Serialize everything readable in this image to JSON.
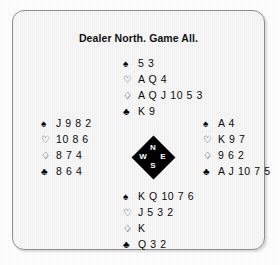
{
  "figure": {
    "title": "Dealer North. Game All.",
    "border_color": "#8e8e8e",
    "panel_color": "#f7f7f7",
    "compass_color": "#000000",
    "text_color": "#0b0b0b"
  },
  "suits": {
    "spade": {
      "name": "spade-pip",
      "glyph": "♠",
      "filled": true
    },
    "heart": {
      "name": "heart-pip",
      "glyph": "♡",
      "filled": false
    },
    "diamond": {
      "name": "diamond-pip",
      "glyph": "♢",
      "filled": false
    },
    "club": {
      "name": "club-pip",
      "glyph": "♣",
      "filled": true
    }
  },
  "compass": {
    "north": "N",
    "west": "W",
    "east": "E",
    "south": "S"
  },
  "hands": {
    "north": {
      "label": "North",
      "spades": "5 3",
      "hearts": "A Q 4",
      "diamonds": "A Q J 10 5 3",
      "clubs": "K 9"
    },
    "west": {
      "label": "West",
      "spades": "J 9 8 2",
      "hearts": "10 8 6",
      "diamonds": "8 7 4",
      "clubs": "8 6 4"
    },
    "east": {
      "label": "East",
      "spades": "A 4",
      "hearts": "K 9 7",
      "diamonds": "9 6 2",
      "clubs": "A J 10 7 5"
    },
    "south": {
      "label": "South",
      "spades": "K Q 10 7 6",
      "hearts": "J 5 3 2",
      "diamonds": "K",
      "clubs": "Q 3 2"
    }
  }
}
